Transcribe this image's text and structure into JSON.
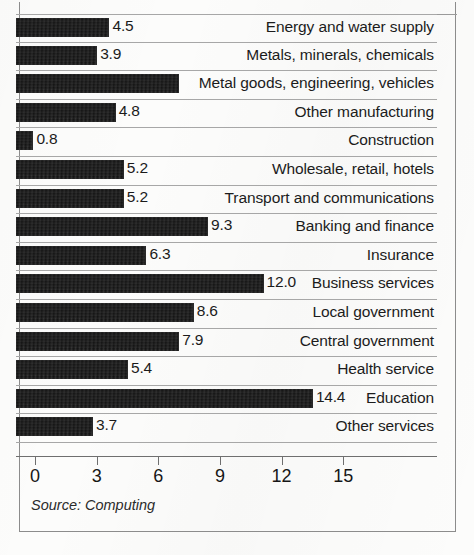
{
  "figure": {
    "source_note": "Source: Computing"
  },
  "chart_data": {
    "type": "bar",
    "orientation": "horizontal",
    "title": "",
    "xlabel": "",
    "ylabel": "",
    "xlim": [
      0,
      18.5
    ],
    "grid": false,
    "legend": null,
    "axis": {
      "ticks": [
        0,
        3,
        6,
        9,
        12,
        15
      ],
      "tick_labels": [
        "0",
        "3",
        "6",
        "9",
        "12",
        "15"
      ]
    },
    "categories": [
      "Energy and water supply",
      "Metals, minerals, chemicals",
      "Metal goods, engineering, vehicles",
      "Other manufacturing",
      "Construction",
      "Wholesale, retail, hotels",
      "Transport and communications",
      "Banking and finance",
      "Insurance",
      "Business services",
      "Local government",
      "Central government",
      "Health service",
      "Education",
      "Other services"
    ],
    "values": [
      4.5,
      3.9,
      7.9,
      4.8,
      0.8,
      5.2,
      5.2,
      9.3,
      6.3,
      12.0,
      8.6,
      7.9,
      5.4,
      14.4,
      3.7
    ],
    "value_labels": [
      "4.5",
      "3.9",
      "",
      "4.8",
      "0.8",
      "5.2",
      "5.2",
      "9.3",
      "6.3",
      "12.0",
      "8.6",
      "7.9",
      "5.4",
      "14.4",
      "3.7"
    ],
    "bar_color": "#121212"
  }
}
